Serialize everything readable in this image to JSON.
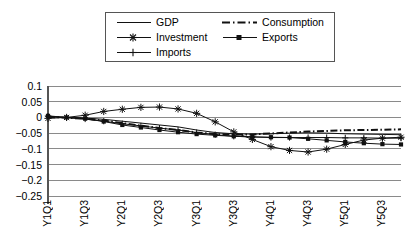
{
  "legend": {
    "entries": [
      {
        "label": "GDP",
        "style": "solid",
        "marker": "none"
      },
      {
        "label": "Consumption",
        "style": "dashdot",
        "marker": "none"
      },
      {
        "label": "Investment",
        "style": "solid",
        "marker": "asterisk"
      },
      {
        "label": "Exports",
        "style": "solid",
        "marker": "square"
      },
      {
        "label": "Imports",
        "style": "solid",
        "marker": "plus"
      }
    ],
    "border_color": "#555555"
  },
  "chart_data": {
    "type": "line",
    "title": "",
    "xlabel": "",
    "ylabel": "",
    "ylim": [
      -0.25,
      0.1
    ],
    "yticks": [
      0.1,
      0.05,
      0,
      -0.05,
      -0.1,
      -0.15,
      -0.2,
      -0.25
    ],
    "ytick_labels": [
      "0.1",
      "0.05",
      "0",
      "−0.05",
      "−0.1",
      "−0.15",
      "−0.2",
      "−0.25"
    ],
    "grid": true,
    "legend_position": "top",
    "x": [
      "Y1Q1",
      "Y1Q2",
      "Y1Q3",
      "Y1Q4",
      "Y2Q1",
      "Y2Q2",
      "Y2Q3",
      "Y2Q4",
      "Y3Q1",
      "Y3Q2",
      "Y3Q3",
      "Y3Q4",
      "Y4Q1",
      "Y4Q2",
      "Y4Q3",
      "Y4Q4",
      "Y5Q1",
      "Y5Q2",
      "Y5Q3",
      "Y5Q4"
    ],
    "xtick_labels": [
      "Y1Q1",
      "Y1Q3",
      "Y2Q1",
      "Y2Q3",
      "Y3Q1",
      "Y3Q3",
      "Y4Q1",
      "Y4Q3",
      "Y5Q1",
      "Y5Q3"
    ],
    "xtick_indices": [
      0,
      2,
      4,
      6,
      8,
      10,
      12,
      14,
      16,
      18
    ],
    "series": [
      {
        "name": "GDP",
        "style": "solid",
        "marker": "none",
        "color": "#111111",
        "values": [
          0.003,
          0.0,
          -0.002,
          -0.006,
          -0.012,
          -0.018,
          -0.024,
          -0.03,
          -0.04,
          -0.048,
          -0.052,
          -0.053,
          -0.052,
          -0.05,
          -0.049,
          -0.05,
          -0.052,
          -0.053,
          -0.054,
          -0.055
        ]
      },
      {
        "name": "Consumption",
        "style": "dashdot",
        "marker": "none",
        "color": "#111111",
        "values": [
          0.002,
          -0.001,
          -0.004,
          -0.01,
          -0.018,
          -0.026,
          -0.034,
          -0.04,
          -0.048,
          -0.053,
          -0.055,
          -0.054,
          -0.051,
          -0.048,
          -0.045,
          -0.043,
          -0.041,
          -0.04,
          -0.039,
          -0.038
        ]
      },
      {
        "name": "Investment",
        "style": "solid",
        "marker": "asterisk",
        "color": "#111111",
        "values": [
          -0.003,
          0.0,
          0.007,
          0.019,
          0.026,
          0.032,
          0.033,
          0.027,
          0.013,
          -0.014,
          -0.046,
          -0.07,
          -0.093,
          -0.105,
          -0.11,
          -0.101,
          -0.086,
          -0.072,
          -0.066,
          -0.063
        ]
      },
      {
        "name": "Exports",
        "style": "solid",
        "marker": "square",
        "color": "#111111",
        "values": [
          0.005,
          0.0,
          -0.004,
          -0.013,
          -0.024,
          -0.032,
          -0.04,
          -0.047,
          -0.053,
          -0.057,
          -0.06,
          -0.062,
          -0.063,
          -0.064,
          -0.068,
          -0.073,
          -0.078,
          -0.082,
          -0.085,
          -0.086
        ]
      },
      {
        "name": "Imports",
        "style": "solid",
        "marker": "plus",
        "color": "#111111",
        "values": [
          0.004,
          -0.001,
          -0.005,
          -0.012,
          -0.02,
          -0.027,
          -0.034,
          -0.04,
          -0.048,
          -0.055,
          -0.06,
          -0.062,
          -0.064,
          -0.064,
          -0.064,
          -0.064,
          -0.065,
          -0.065,
          -0.066,
          -0.066
        ]
      }
    ]
  }
}
